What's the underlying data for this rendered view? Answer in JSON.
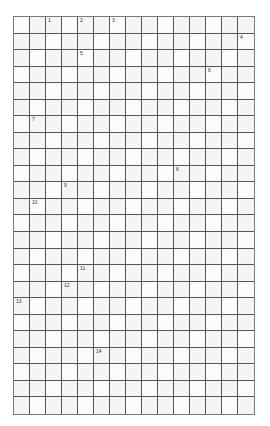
{
  "puzzle": {
    "type": "crossword",
    "columns": 15,
    "rows": 24,
    "colors": {
      "grid_line": "#555555",
      "cell_fill": "#f5f5f5",
      "number_text": "#333333"
    },
    "clue_numbers": [
      {
        "n": "1",
        "col": 2,
        "row": 0
      },
      {
        "n": "2",
        "col": 4,
        "row": 0
      },
      {
        "n": "3",
        "col": 6,
        "row": 0
      },
      {
        "n": "4",
        "col": 14,
        "row": 1
      },
      {
        "n": "5",
        "col": 4,
        "row": 2
      },
      {
        "n": "6",
        "col": 12,
        "row": 3
      },
      {
        "n": "7",
        "col": 1,
        "row": 6
      },
      {
        "n": "8",
        "col": 10,
        "row": 9
      },
      {
        "n": "9",
        "col": 3,
        "row": 10
      },
      {
        "n": "10",
        "col": 1,
        "row": 11
      },
      {
        "n": "11",
        "col": 4,
        "row": 15
      },
      {
        "n": "12",
        "col": 3,
        "row": 16
      },
      {
        "n": "13",
        "col": 0,
        "row": 17
      },
      {
        "n": "14",
        "col": 5,
        "row": 20
      }
    ]
  }
}
